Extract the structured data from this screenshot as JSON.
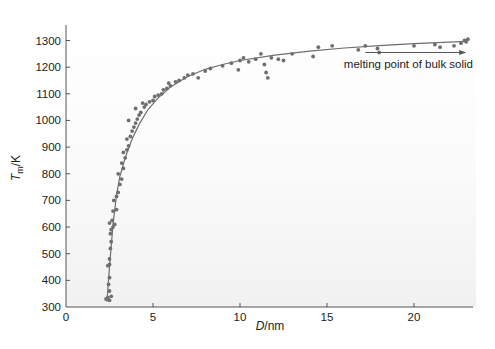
{
  "chart_data": {
    "type": "scatter",
    "title": "",
    "xlabel": "D/nm",
    "xlabel_italic": "D",
    "xlabel_unit": "/nm",
    "ylabel": "Tm/K",
    "ylabel_italic": "T",
    "ylabel_sub": "m",
    "ylabel_unit": "/K",
    "xlim": [
      0,
      23.4
    ],
    "ylim": [
      300,
      1350
    ],
    "xticks": [
      0,
      5,
      10,
      15,
      20
    ],
    "yticks": [
      300,
      400,
      500,
      600,
      700,
      800,
      900,
      1000,
      1100,
      1200,
      1300
    ],
    "grid": false,
    "legend": null,
    "colors": {
      "points": "#6e6e6e",
      "fit": "#6e6e6e",
      "axis": "#555555",
      "background": "#f3f3f3"
    },
    "annotation": {
      "text": "melting point of bulk solid",
      "arrow_from_x": 17.2,
      "arrow_to_x": 23.0,
      "arrow_y": 1255
    },
    "fit_curve": {
      "x": [
        2.35,
        2.5,
        2.7,
        2.9,
        3.1,
        3.4,
        3.8,
        4.2,
        4.7,
        5.3,
        6.0,
        7.0,
        8.0,
        9.0,
        10.0,
        12.0,
        14.0,
        16.0,
        18.0,
        20.0,
        22.0,
        23.0
      ],
      "y": [
        320,
        450,
        610,
        720,
        790,
        860,
        930,
        985,
        1040,
        1085,
        1125,
        1165,
        1192,
        1210,
        1225,
        1245,
        1260,
        1272,
        1281,
        1288,
        1294,
        1297
      ]
    },
    "series": [
      {
        "name": "measured",
        "points": [
          [
            2.3,
            330
          ],
          [
            2.4,
            335
          ],
          [
            2.5,
            325
          ],
          [
            2.6,
            340
          ],
          [
            2.5,
            360
          ],
          [
            2.45,
            385
          ],
          [
            2.5,
            410
          ],
          [
            2.4,
            455
          ],
          [
            2.5,
            460
          ],
          [
            2.5,
            480
          ],
          [
            2.55,
            520
          ],
          [
            2.6,
            545
          ],
          [
            2.55,
            575
          ],
          [
            2.6,
            590
          ],
          [
            2.7,
            600
          ],
          [
            2.5,
            615
          ],
          [
            2.65,
            625
          ],
          [
            2.8,
            610
          ],
          [
            2.7,
            660
          ],
          [
            2.9,
            665
          ],
          [
            2.75,
            700
          ],
          [
            2.9,
            715
          ],
          [
            3.0,
            730
          ],
          [
            3.1,
            760
          ],
          [
            3.2,
            780
          ],
          [
            3.0,
            800
          ],
          [
            3.3,
            820
          ],
          [
            3.2,
            840
          ],
          [
            3.4,
            860
          ],
          [
            3.3,
            880
          ],
          [
            3.5,
            890
          ],
          [
            3.6,
            905
          ],
          [
            3.5,
            930
          ],
          [
            3.7,
            940
          ],
          [
            3.8,
            960
          ],
          [
            3.9,
            975
          ],
          [
            4.0,
            990
          ],
          [
            3.6,
            1000
          ],
          [
            4.1,
            1005
          ],
          [
            4.2,
            1020
          ],
          [
            4.3,
            1030
          ],
          [
            4.0,
            1045
          ],
          [
            4.5,
            1050
          ],
          [
            4.6,
            1060
          ],
          [
            4.4,
            1065
          ],
          [
            4.8,
            1070
          ],
          [
            5.0,
            1075
          ],
          [
            5.1,
            1090
          ],
          [
            5.3,
            1095
          ],
          [
            5.5,
            1100
          ],
          [
            5.6,
            1115
          ],
          [
            5.8,
            1120
          ],
          [
            6.0,
            1130
          ],
          [
            5.9,
            1140
          ],
          [
            6.3,
            1145
          ],
          [
            6.5,
            1150
          ],
          [
            6.8,
            1160
          ],
          [
            7.0,
            1170
          ],
          [
            7.3,
            1175
          ],
          [
            7.6,
            1160
          ],
          [
            8.0,
            1185
          ],
          [
            8.3,
            1195
          ],
          [
            9.0,
            1205
          ],
          [
            9.5,
            1215
          ],
          [
            10.0,
            1225
          ],
          [
            9.9,
            1190
          ],
          [
            10.2,
            1235
          ],
          [
            10.5,
            1220
          ],
          [
            10.9,
            1230
          ],
          [
            11.2,
            1250
          ],
          [
            11.4,
            1210
          ],
          [
            11.5,
            1180
          ],
          [
            11.6,
            1160
          ],
          [
            11.8,
            1235
          ],
          [
            12.2,
            1230
          ],
          [
            12.5,
            1225
          ],
          [
            13.0,
            1250
          ],
          [
            14.2,
            1240
          ],
          [
            14.5,
            1275
          ],
          [
            15.3,
            1280
          ],
          [
            16.8,
            1265
          ],
          [
            17.2,
            1280
          ],
          [
            17.9,
            1270
          ],
          [
            18.0,
            1255
          ],
          [
            20.0,
            1280
          ],
          [
            21.2,
            1285
          ],
          [
            21.5,
            1275
          ],
          [
            22.3,
            1280
          ],
          [
            22.7,
            1290
          ],
          [
            23.0,
            1295
          ],
          [
            23.1,
            1305
          ],
          [
            22.9,
            1300
          ]
        ]
      }
    ]
  },
  "labels": {
    "x_axis_italic": "D",
    "x_axis_rest": "/nm",
    "y_axis_italic": "T",
    "y_axis_sub": "m",
    "y_axis_rest": "/K",
    "annotation": "melting point of bulk solid"
  }
}
